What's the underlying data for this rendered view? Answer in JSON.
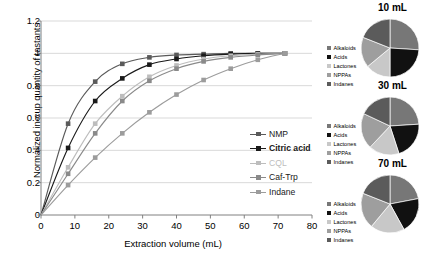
{
  "chart_data": [
    {
      "type": "line",
      "title": "",
      "xlabel": "Extraction volume (mL)",
      "ylabel": "Normalized in-cup quantity of tastants",
      "xlim": [
        0,
        80
      ],
      "ylim": [
        0,
        1.2
      ],
      "xticks": [
        0,
        10,
        20,
        30,
        40,
        50,
        60,
        70,
        80
      ],
      "xticklabels": [
        "0",
        "10",
        "20",
        "30",
        "40",
        "50",
        "60",
        "70",
        "80"
      ],
      "yticks": [
        0,
        0.2,
        0.4,
        0.6,
        0.8,
        1,
        1.2
      ],
      "yticklabels": [
        "0",
        "0.2",
        "0.4",
        "0.6",
        "0.8",
        "1",
        "1.2"
      ],
      "grid": "horizontal",
      "legend_position": "inside-lower-right",
      "series": [
        {
          "name": "NMP",
          "color": "#5a5a5a",
          "marker": "square",
          "x": [
            0,
            8,
            16,
            24,
            32,
            40,
            48,
            56,
            64,
            72
          ],
          "y": [
            0,
            0.565,
            0.825,
            0.935,
            0.975,
            0.99,
            0.995,
            1.0,
            1.0,
            1.0
          ]
        },
        {
          "name": "Citric acid",
          "color": "#1a1a1a",
          "marker": "square",
          "x": [
            0,
            8,
            16,
            24,
            32,
            40,
            48,
            56,
            64,
            72
          ],
          "y": [
            0,
            0.415,
            0.705,
            0.845,
            0.93,
            0.965,
            0.985,
            0.995,
            1.0,
            1.0
          ]
        },
        {
          "name": "CQL",
          "color": "#bdbdbd",
          "marker": "square",
          "x": [
            0,
            8,
            16,
            24,
            32,
            40,
            48,
            56,
            64,
            72
          ],
          "y": [
            0,
            0.295,
            0.565,
            0.735,
            0.855,
            0.925,
            0.965,
            0.985,
            0.995,
            1.0
          ]
        },
        {
          "name": "Caf-Trp",
          "color": "#8a8a8a",
          "marker": "square",
          "x": [
            0,
            8,
            16,
            24,
            32,
            40,
            48,
            56,
            64,
            72
          ],
          "y": [
            0,
            0.255,
            0.505,
            0.705,
            0.83,
            0.905,
            0.95,
            0.975,
            0.99,
            1.0
          ]
        },
        {
          "name": "Indane",
          "color": "#9c9c9c",
          "marker": "square",
          "x": [
            0,
            8,
            16,
            24,
            32,
            40,
            48,
            56,
            64,
            72
          ],
          "y": [
            0,
            0.185,
            0.355,
            0.505,
            0.635,
            0.745,
            0.835,
            0.905,
            0.96,
            1.0
          ]
        }
      ]
    },
    {
      "type": "pie",
      "title": "10 mL",
      "labels": [
        "Alkaloids",
        "Acids",
        "Lactones",
        "NPPAs",
        "Indanes"
      ],
      "values": [
        26,
        24,
        14,
        17,
        19
      ],
      "colors": [
        "#777777",
        "#111111",
        "#c8c8c8",
        "#9e9e9e",
        "#5b5b5b"
      ],
      "legend_position": "left"
    },
    {
      "type": "pie",
      "title": "30 mL",
      "labels": [
        "Alkaloids",
        "Acids",
        "Lactones",
        "NPPAs",
        "Indanes"
      ],
      "values": [
        24,
        21,
        17,
        20,
        18
      ],
      "colors": [
        "#777777",
        "#111111",
        "#c8c8c8",
        "#9e9e9e",
        "#5b5b5b"
      ],
      "legend_position": "left"
    },
    {
      "type": "pie",
      "title": "70 mL",
      "labels": [
        "Alkaloids",
        "Acids",
        "Lactones",
        "NPPAs",
        "Indanes"
      ],
      "values": [
        22,
        20,
        19,
        20,
        19
      ],
      "colors": [
        "#777777",
        "#111111",
        "#c8c8c8",
        "#9e9e9e",
        "#5b5b5b"
      ],
      "legend_position": "left"
    }
  ],
  "linechart": {
    "xlabel": "Extraction volume (mL)",
    "ylabel": "Normalized in-cup quantity of tastants",
    "xticklabels": [
      "0",
      "10",
      "20",
      "30",
      "40",
      "50",
      "60",
      "70",
      "80"
    ],
    "yticklabels": [
      "1.2",
      "1",
      "0.8",
      "0.6",
      "0.4",
      "0.2",
      "0"
    ],
    "legend": [
      {
        "label": "NMP",
        "color": "#5a5a5a"
      },
      {
        "label": "Citric acid",
        "color": "#1a1a1a"
      },
      {
        "label": "CQL",
        "color": "#bdbdbd"
      },
      {
        "label": "Caf-Trp",
        "color": "#8a8a8a"
      },
      {
        "label": "Indane",
        "color": "#9c9c9c"
      }
    ]
  },
  "pies": [
    {
      "title": "10 mL",
      "legend": [
        {
          "label": "Alkaloids",
          "color": "#777777"
        },
        {
          "label": "Acids",
          "color": "#111111"
        },
        {
          "label": "Lactones",
          "color": "#c8c8c8"
        },
        {
          "label": "NPPAs",
          "color": "#9e9e9e"
        },
        {
          "label": "Indanes",
          "color": "#5b5b5b"
        }
      ]
    },
    {
      "title": "30 mL",
      "legend": [
        {
          "label": "Alkaloids",
          "color": "#777777"
        },
        {
          "label": "Acids",
          "color": "#111111"
        },
        {
          "label": "Lactones",
          "color": "#c8c8c8"
        },
        {
          "label": "NPPAs",
          "color": "#9e9e9e"
        },
        {
          "label": "Indanes",
          "color": "#5b5b5b"
        }
      ]
    },
    {
      "title": "70 mL",
      "legend": [
        {
          "label": "Alkaloids",
          "color": "#777777"
        },
        {
          "label": "Acids",
          "color": "#111111"
        },
        {
          "label": "Lactones",
          "color": "#c8c8c8"
        },
        {
          "label": "NPPAs",
          "color": "#9e9e9e"
        },
        {
          "label": "Indanes",
          "color": "#5b5b5b"
        }
      ]
    }
  ],
  "colors": {
    "grid": "#d9d9d9",
    "axis": "#808080",
    "background": "#ffffff"
  }
}
